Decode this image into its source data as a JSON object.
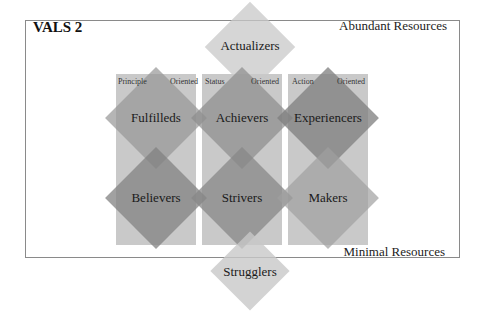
{
  "diagram": {
    "title": "VALS 2",
    "resources": {
      "top": "Abundant Resources",
      "bottom": "Minimal Resources"
    },
    "columns": [
      {
        "left": "Principle",
        "right": "Oriented"
      },
      {
        "left": "Status",
        "right": "Oriented"
      },
      {
        "left": "Action",
        "right": "Oriented"
      }
    ],
    "segments": {
      "top": "Actualizers",
      "row1": [
        "Fulfilleds",
        "Achievers",
        "Experiencers"
      ],
      "row2": [
        "Believers",
        "Strivers",
        "Makers"
      ],
      "bottom": "Strugglers"
    },
    "colors": {
      "column": "#c9c9c9",
      "diamond_light": "#d6d6d6",
      "diamond_mid": "#a9a9a9",
      "diamond_dark": "#959595",
      "frame": "#8a8a8a"
    }
  }
}
